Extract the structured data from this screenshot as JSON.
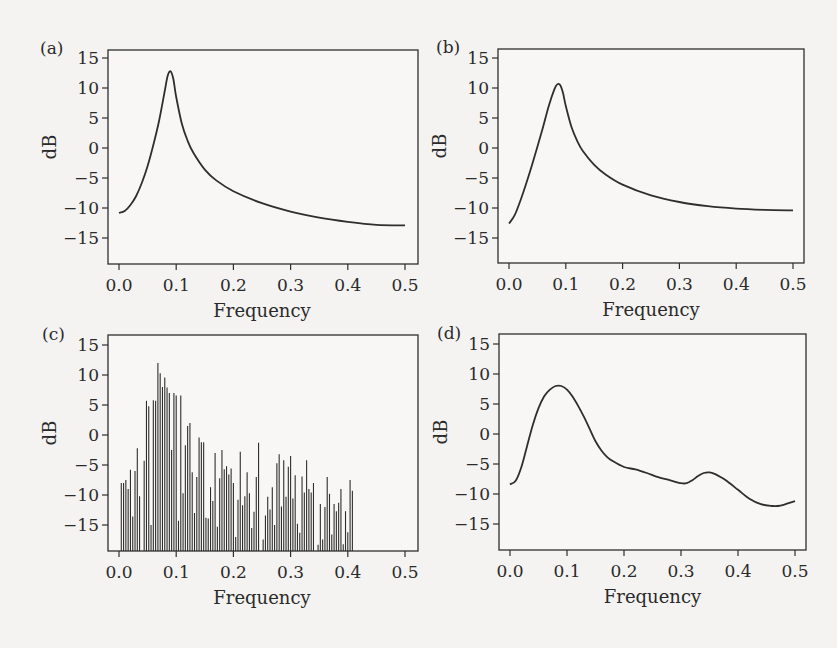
{
  "figure": {
    "background": "#f4f3f1",
    "line_color": "#2e2e2e",
    "panels": [
      {
        "id": "a",
        "label": "(a)",
        "xlabel": "Frequency",
        "ylabel": "dB"
      },
      {
        "id": "b",
        "label": "(b)",
        "xlabel": "Frequency",
        "ylabel": "dB"
      },
      {
        "id": "c",
        "label": "(c)",
        "xlabel": "Frequency",
        "ylabel": "dB"
      },
      {
        "id": "d",
        "label": "(d)",
        "xlabel": "Frequency",
        "ylabel": "dB"
      }
    ],
    "xticks": [
      "0.0",
      "0.1",
      "0.2",
      "0.3",
      "0.4",
      "0.5"
    ],
    "yticks": [
      "15",
      "10",
      "5",
      "0",
      "−5",
      "−10",
      "−15"
    ]
  },
  "chart_data": [
    {
      "panel": "(a)",
      "type": "line",
      "title": "",
      "xlabel": "Frequency",
      "ylabel": "dB",
      "xlim": [
        0.0,
        0.5
      ],
      "ylim": [
        -19.5,
        16.5
      ],
      "xticks": [
        0.0,
        0.1,
        0.2,
        0.3,
        0.4,
        0.5
      ],
      "yticks": [
        15,
        10,
        5,
        0,
        -5,
        -10,
        -15
      ],
      "grid": false,
      "x": [
        0.0,
        0.01,
        0.02,
        0.03,
        0.04,
        0.05,
        0.06,
        0.07,
        0.08,
        0.085,
        0.09,
        0.095,
        0.1,
        0.11,
        0.12,
        0.13,
        0.15,
        0.17,
        0.2,
        0.25,
        0.3,
        0.35,
        0.4,
        0.45,
        0.5
      ],
      "y": [
        -10.8,
        -10.5,
        -9.5,
        -8.0,
        -5.8,
        -3.0,
        0.5,
        4.5,
        9.5,
        12.0,
        12.8,
        11.5,
        8.5,
        4.0,
        1.2,
        -0.8,
        -3.6,
        -5.4,
        -7.2,
        -9.2,
        -10.6,
        -11.6,
        -12.3,
        -12.8,
        -12.9
      ]
    },
    {
      "panel": "(b)",
      "type": "line",
      "title": "",
      "xlabel": "Frequency",
      "ylabel": "dB",
      "xlim": [
        0.0,
        0.5
      ],
      "ylim": [
        -19.5,
        16.5
      ],
      "xticks": [
        0.0,
        0.1,
        0.2,
        0.3,
        0.4,
        0.5
      ],
      "yticks": [
        15,
        10,
        5,
        0,
        -5,
        -10,
        -15
      ],
      "grid": false,
      "x": [
        0.0,
        0.01,
        0.02,
        0.03,
        0.04,
        0.05,
        0.06,
        0.07,
        0.08,
        0.085,
        0.09,
        0.095,
        0.1,
        0.11,
        0.12,
        0.13,
        0.15,
        0.17,
        0.2,
        0.25,
        0.3,
        0.35,
        0.4,
        0.45,
        0.5
      ],
      "y": [
        -12.6,
        -11.2,
        -8.8,
        -6.0,
        -3.0,
        0.2,
        3.5,
        7.0,
        9.8,
        10.6,
        10.5,
        9.2,
        7.0,
        3.5,
        1.2,
        -0.5,
        -2.8,
        -4.4,
        -6.1,
        -7.9,
        -9.0,
        -9.7,
        -10.1,
        -10.3,
        -10.4
      ]
    },
    {
      "panel": "(c)",
      "type": "bar",
      "title": "",
      "xlabel": "Frequency",
      "ylabel": "dB",
      "xlim": [
        0.0,
        0.5
      ],
      "ylim": [
        -19.5,
        16.5
      ],
      "baseline": -19.5,
      "xticks": [
        0.0,
        0.1,
        0.2,
        0.3,
        0.4,
        0.5
      ],
      "yticks": [
        15,
        10,
        5,
        0,
        -5,
        -10,
        -15
      ],
      "grid": false,
      "x_start": 0.004,
      "x_step": 0.004,
      "values": [
        -8,
        -8,
        -7.5,
        -9,
        -5.8,
        -13.6,
        -6,
        -2.2,
        -10.2,
        -19.5,
        -4.3,
        5.7,
        4.8,
        -15,
        5.8,
        5.7,
        12,
        10.3,
        8,
        9.6,
        7.9,
        7,
        -2.5,
        7,
        6.6,
        -14.3,
        6.6,
        -9.7,
        -1.7,
        1.5,
        2,
        -6.2,
        -13,
        -7,
        -0.4,
        -1.2,
        -1.2,
        -13.8,
        -13.9,
        -8.7,
        -11,
        -3,
        -15.3,
        -7.2,
        -2.5,
        -5.7,
        -5.2,
        -6.6,
        -5.6,
        -8,
        -17,
        -10.8,
        -2.8,
        -11.7,
        -10.2,
        -6.2,
        -9.7,
        -15.5,
        -12.8,
        -7,
        -1.3,
        -19.5,
        -17.4,
        -13.4,
        -10.3,
        -12.4,
        -8.7,
        -15,
        -4.7,
        -3.2,
        -11.9,
        -4.2,
        -10.3,
        -5.3,
        -3.5,
        -10.6,
        -6.7,
        -14.8,
        -16.3,
        -6.9,
        -9.6,
        -4.2,
        -9,
        -9.6,
        -8,
        -19.5,
        -18.3,
        -11.5,
        -17.4,
        -12,
        -7,
        -9.8,
        -16.6,
        -11.5,
        -12.7,
        -11.3,
        -9,
        -18.2,
        -12.7,
        -16.2,
        -7.5,
        -9.3,
        -19.5,
        -19.5,
        -19.5,
        -19.5,
        -19.5,
        -19.5,
        -19.5,
        -19.5,
        -19.5,
        -19.5,
        -19.5,
        -19.5,
        -19.5,
        -19.5,
        -19.5,
        -19.5,
        -19.5,
        -19.5,
        -19.5,
        -19.5,
        -19.5,
        -19.5,
        -19.5
      ]
    },
    {
      "panel": "(d)",
      "type": "line",
      "title": "",
      "xlabel": "Frequency",
      "ylabel": "dB",
      "xlim": [
        0.0,
        0.5
      ],
      "ylim": [
        -19.5,
        16.5
      ],
      "xticks": [
        0.0,
        0.1,
        0.2,
        0.3,
        0.4,
        0.5
      ],
      "yticks": [
        15,
        10,
        5,
        0,
        -5,
        -10,
        -15
      ],
      "grid": false,
      "x": [
        0.0,
        0.01,
        0.02,
        0.03,
        0.04,
        0.05,
        0.06,
        0.07,
        0.08,
        0.09,
        0.1,
        0.11,
        0.12,
        0.13,
        0.14,
        0.15,
        0.16,
        0.17,
        0.18,
        0.2,
        0.22,
        0.24,
        0.26,
        0.28,
        0.3,
        0.31,
        0.32,
        0.33,
        0.34,
        0.35,
        0.36,
        0.37,
        0.38,
        0.4,
        0.42,
        0.44,
        0.46,
        0.47,
        0.48,
        0.5
      ],
      "y": [
        -8.4,
        -7.8,
        -5.5,
        -2.0,
        1.5,
        4.3,
        6.3,
        7.4,
        8.0,
        8.0,
        7.4,
        6.2,
        4.6,
        2.8,
        0.8,
        -1.2,
        -2.7,
        -3.8,
        -4.5,
        -5.5,
        -5.9,
        -6.5,
        -7.2,
        -7.7,
        -8.2,
        -8.2,
        -7.7,
        -7.0,
        -6.5,
        -6.4,
        -6.7,
        -7.2,
        -7.8,
        -9.3,
        -10.8,
        -11.7,
        -12.0,
        -12.0,
        -11.8,
        -11.2
      ]
    }
  ]
}
